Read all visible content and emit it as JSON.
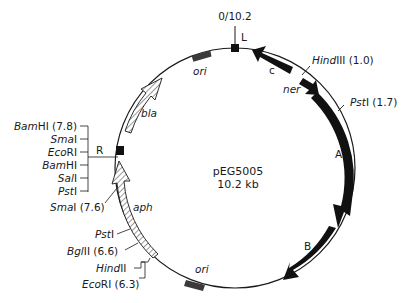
{
  "plasmid": {
    "name": "pEG5005",
    "size": "10.2 kb",
    "origin_label": "0/10.2"
  },
  "markers": {
    "L": "L",
    "R": "R"
  },
  "genes": {
    "c": "c",
    "ner": "ner",
    "A": "A",
    "B": "B",
    "bla": "bla",
    "aph": "aph",
    "ori_top": "ori",
    "ori_bottom": "ori"
  },
  "sites": {
    "hindiii": {
      "name": "Hind",
      "suffix": "III (1.0)"
    },
    "psti_right": {
      "name": "Pst",
      "suffix": "I (1.7)"
    },
    "polylinker": [
      {
        "name": "Bam",
        "suffix": "HI (7.8)"
      },
      {
        "name": "Sma",
        "suffix": "I"
      },
      {
        "name": "Eco",
        "suffix": "RI"
      },
      {
        "name": "Bam",
        "suffix": "HI"
      },
      {
        "name": "Sal",
        "suffix": "I"
      },
      {
        "name": "Pst",
        "suffix": "I"
      }
    ],
    "smai": {
      "name": "Sma",
      "suffix": "I (7.6)"
    },
    "psti_aph": {
      "name": "Pst",
      "suffix": "I"
    },
    "bglii": {
      "name": "Bgl",
      "suffix": "II (6.6)"
    },
    "hindii": {
      "name": "Hind",
      "suffix": "II"
    },
    "ecori": {
      "name": "Eco",
      "suffix": "RI (6.3)"
    }
  },
  "colors": {
    "line": "#1a1a1a",
    "ori_fill": "#3a3a3a",
    "hatch_fill": "#ffffff"
  }
}
